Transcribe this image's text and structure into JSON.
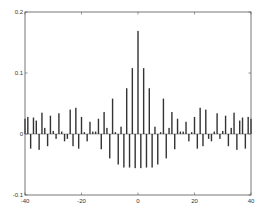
{
  "chart_data": {
    "type": "bar",
    "title": "",
    "xlabel": "",
    "ylabel": "",
    "xlim": [
      -40,
      40
    ],
    "ylim": [
      -0.1,
      0.2
    ],
    "grid": false,
    "legend": null,
    "x_ticks": [
      -40,
      -20,
      0,
      20,
      40
    ],
    "x_tick_labels": [
      "-40",
      "-20",
      "0",
      "20",
      "40"
    ],
    "y_ticks": [
      -0.1,
      0,
      0.1,
      0.2
    ],
    "y_tick_labels": [
      "-0.1",
      "0",
      "0.1",
      "0.2"
    ],
    "bar_color": "#333333",
    "x": [
      -40,
      -39,
      -38,
      -37,
      -36,
      -35,
      -34,
      -33,
      -32,
      -31,
      -30,
      -29,
      -28,
      -27,
      -26,
      -25,
      -24,
      -23,
      -22,
      -21,
      -20,
      -19,
      -18,
      -17,
      -16,
      -15,
      -14,
      -13,
      -12,
      -11,
      -10,
      -9,
      -8,
      -7,
      -6,
      -5,
      -4,
      -3,
      -2,
      -1,
      0,
      1,
      2,
      3,
      4,
      5,
      6,
      7,
      8,
      9,
      10,
      11,
      12,
      13,
      14,
      15,
      16,
      17,
      18,
      19,
      20,
      21,
      22,
      23,
      24,
      25,
      26,
      27,
      28,
      29,
      30,
      31,
      32,
      33,
      34,
      35,
      36,
      37,
      38,
      39,
      40
    ],
    "values": [
      0.025,
      0.028,
      -0.024,
      0.027,
      0.022,
      -0.026,
      0.035,
      0.01,
      -0.02,
      0.03,
      0.005,
      -0.008,
      0.034,
      0.004,
      -0.012,
      -0.008,
      0.04,
      -0.02,
      0.043,
      -0.024,
      0.028,
      0.003,
      -0.012,
      0.02,
      0.004,
      0.004,
      0.025,
      -0.025,
      0.036,
      0.01,
      -0.04,
      0.058,
      0.003,
      -0.05,
      0.012,
      -0.055,
      0.075,
      -0.055,
      0.108,
      -0.056,
      0.169,
      -0.056,
      0.108,
      -0.055,
      0.075,
      -0.055,
      0.012,
      -0.05,
      0.003,
      0.058,
      -0.04,
      0.01,
      0.036,
      -0.025,
      0.025,
      0.004,
      0.004,
      0.02,
      -0.012,
      0.003,
      0.028,
      -0.024,
      0.043,
      -0.02,
      0.04,
      -0.008,
      -0.012,
      0.004,
      0.034,
      -0.008,
      0.005,
      0.03,
      -0.02,
      0.01,
      0.035,
      -0.026,
      0.022,
      0.027,
      -0.024,
      0.028,
      0.025
    ]
  }
}
